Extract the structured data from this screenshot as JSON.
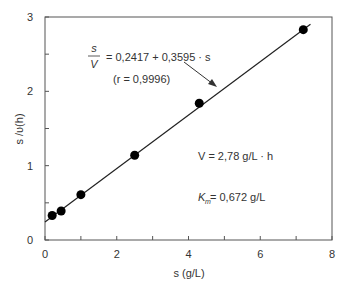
{
  "chart_data": {
    "type": "scatter",
    "title": "",
    "xlabel": "s (g/L)",
    "ylabel": "s /υ(h)",
    "xlim": [
      0,
      8
    ],
    "ylim": [
      0,
      3
    ],
    "x_ticks": [
      0,
      2,
      4,
      6,
      8
    ],
    "y_ticks": [
      0,
      1,
      2,
      3
    ],
    "grid": false,
    "series": [
      {
        "name": "data",
        "type": "scatter",
        "x": [
          0.2,
          0.45,
          1.0,
          2.5,
          4.3,
          7.2
        ],
        "y": [
          0.33,
          0.39,
          0.61,
          1.14,
          1.84,
          2.83
        ]
      },
      {
        "name": "fit",
        "type": "line",
        "intercept": 0.2417,
        "slope": 0.3595,
        "x_range": [
          0,
          7.4
        ]
      }
    ],
    "annotations": {
      "equation_lhs_num": "s",
      "equation_lhs_den": "V",
      "equation_rhs": "= 0,2417 + 0,3595 · s",
      "correlation": "(r = 0,9996)",
      "vmax": "V = 2,78 g/L · h",
      "km": "K",
      "km_sub": "m",
      "km_value": " = 0,672 g/L"
    }
  }
}
